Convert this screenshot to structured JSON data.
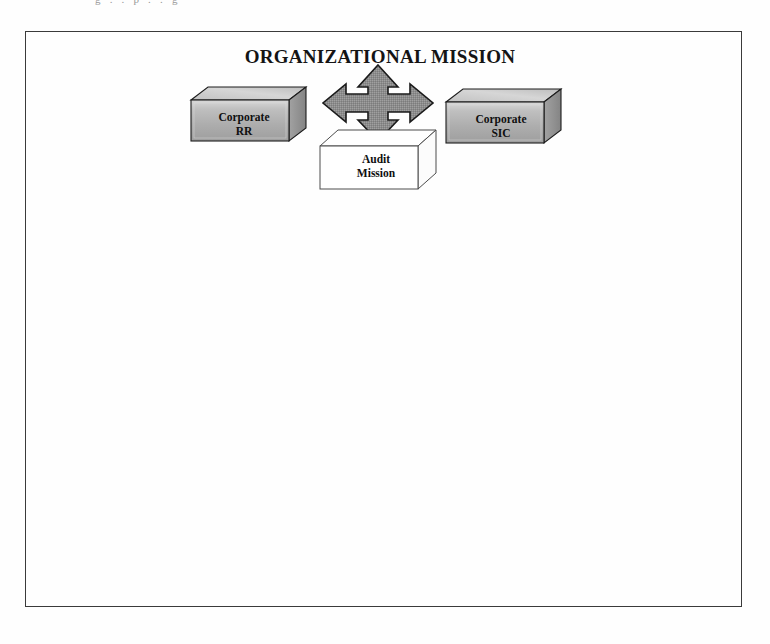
{
  "page": {
    "background_color": "#ffffff",
    "scan_remnant_text": "g  .  .  p  .  .  g",
    "frame": {
      "border_color": "#3a3a3a"
    }
  },
  "diagram": {
    "title": "ORGANIZATIONAL MISSION",
    "title_color": "#141414",
    "arrow": {
      "name": "four-way-arrow",
      "directions": [
        "up",
        "down",
        "left",
        "right"
      ],
      "fill_color": "#8c8c8c",
      "stroke_color": "#1a1a1a"
    },
    "nodes": [
      {
        "id": "corporate-rr",
        "line1": "Corporate",
        "line2": "RR",
        "style": "gray-3d-box",
        "face_color": "#b3b3b3",
        "top_color": "#cfcfcf",
        "side_color": "#8f8f8f",
        "stroke_color": "#1a1a1a"
      },
      {
        "id": "corporate-sic",
        "line1": "Corporate",
        "line2": "SIC",
        "style": "gray-3d-box",
        "face_color": "#b3b3b3",
        "top_color": "#cfcfcf",
        "side_color": "#8f8f8f",
        "stroke_color": "#1a1a1a"
      },
      {
        "id": "audit-mission",
        "line1": "Audit",
        "line2": "Mission",
        "style": "white-3d-box",
        "face_color": "#ffffff",
        "top_color": "#ffffff",
        "side_color": "#fbfbfb",
        "stroke_color": "#4a4a4a"
      }
    ]
  }
}
